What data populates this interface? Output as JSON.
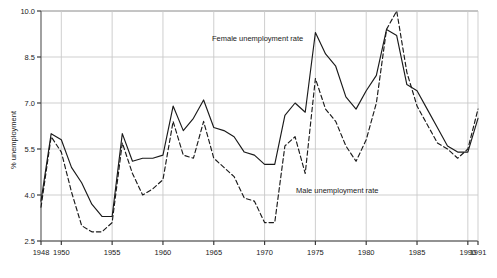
{
  "chart_data": {
    "type": "line",
    "title": "",
    "xlabel": "",
    "ylabel": "% unemployment",
    "xlim": [
      1948,
      1991
    ],
    "ylim": [
      2.5,
      10.0
    ],
    "grid": true,
    "legend_position": "inline-annotations",
    "xticks": [
      "1948",
      "1950",
      "1955",
      "1960",
      "1965",
      "1970",
      "1975",
      "1980",
      "1985",
      "1990",
      "1991"
    ],
    "xtick_values": [
      1948,
      1950,
      1955,
      1960,
      1965,
      1970,
      1975,
      1980,
      1985,
      1990,
      1991
    ],
    "yticks": [
      "2.5",
      "4.0",
      "5.5",
      "7.0",
      "8.5",
      "10.0"
    ],
    "ytick_values": [
      2.5,
      4.0,
      5.5,
      7.0,
      8.5,
      10.0
    ],
    "x": [
      1948,
      1949,
      1950,
      1951,
      1952,
      1953,
      1954,
      1955,
      1956,
      1957,
      1958,
      1959,
      1960,
      1961,
      1962,
      1963,
      1964,
      1965,
      1966,
      1967,
      1968,
      1969,
      1970,
      1971,
      1972,
      1973,
      1974,
      1975,
      1976,
      1977,
      1978,
      1979,
      1980,
      1981,
      1982,
      1983,
      1984,
      1985,
      1986,
      1987,
      1988,
      1989,
      1990,
      1991
    ],
    "series": [
      {
        "name": "Female unemployment rate",
        "style": "solid",
        "color": "#1a1a1a",
        "annotation": "Female unemployment rate",
        "values": [
          3.8,
          6.0,
          5.8,
          4.9,
          4.4,
          3.7,
          3.3,
          3.3,
          6.0,
          5.1,
          5.2,
          5.2,
          5.3,
          6.9,
          6.1,
          6.5,
          7.1,
          6.2,
          6.1,
          5.9,
          5.4,
          5.3,
          5.0,
          5.0,
          6.6,
          7.0,
          6.7,
          9.3,
          8.6,
          8.2,
          7.2,
          6.8,
          7.4,
          7.9,
          9.4,
          9.2,
          7.6,
          7.4,
          6.8,
          6.2,
          5.6,
          5.4,
          5.4,
          6.5
        ]
      },
      {
        "name": "Male unemployment rate",
        "style": "dashed",
        "color": "#1a1a1a",
        "annotation": "Male unemployment rate",
        "values": [
          3.6,
          5.9,
          5.4,
          4.1,
          3.0,
          2.8,
          2.8,
          3.1,
          5.7,
          4.7,
          4.0,
          4.2,
          4.5,
          6.4,
          5.3,
          5.2,
          6.4,
          5.2,
          4.9,
          4.6,
          3.9,
          3.8,
          3.1,
          3.1,
          5.6,
          5.9,
          4.7,
          7.8,
          6.8,
          6.4,
          5.6,
          5.1,
          5.8,
          7.0,
          9.4,
          10.0,
          8.0,
          6.9,
          6.3,
          5.7,
          5.5,
          5.2,
          5.5,
          6.8
        ]
      }
    ]
  },
  "axis": {
    "y_title": "% unemployment"
  }
}
